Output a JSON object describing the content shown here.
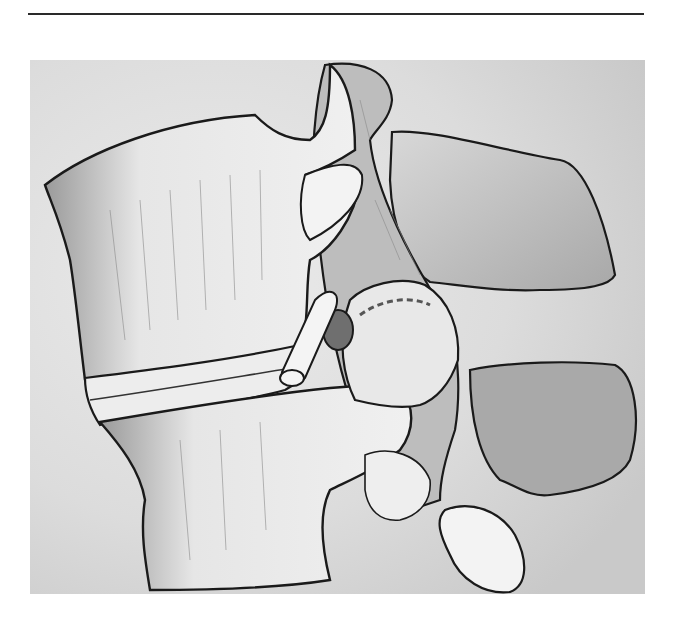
{
  "page": {
    "top_rule": true,
    "figure": {
      "kind": "anatomical illustration",
      "subject": "lateral view of two lumbar vertebrae with intervertebral disc, facet joint and emerging nerve root",
      "style": "grayscale pencil/ink drawing",
      "colors": {
        "background": "#e2e2e2",
        "bone_fill": "#f2f2f2",
        "shade": "#9a9a9a",
        "outline": "#1a1a1a"
      },
      "structures": [
        "upper-vertebral-body",
        "intervertebral-disc",
        "lower-vertebral-body",
        "superior-articular-process",
        "upper-transverse-process",
        "lower-transverse-process",
        "facet-joint",
        "nerve-root",
        "dorsal-root-ganglion",
        "inferior-articular-process",
        "spinous-process-tip"
      ]
    },
    "caption": ""
  }
}
